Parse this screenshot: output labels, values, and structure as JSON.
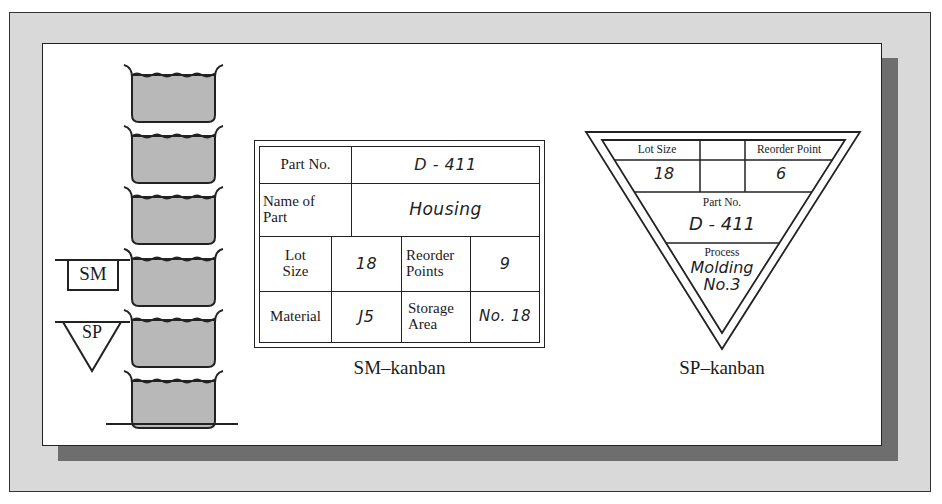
{
  "figure": {
    "left_stack": {
      "container_count": 6,
      "markers": [
        {
          "type": "SM",
          "shape": "rectangle",
          "label": "SM",
          "at_container": 4
        },
        {
          "type": "SP",
          "shape": "inverted-triangle",
          "label": "SP",
          "at_container": 5
        }
      ]
    },
    "sm_kanban": {
      "caption": "SM–kanban",
      "part_no_label": "Part No.",
      "part_no_value": "D - 411",
      "name_label_1": "Name of",
      "name_label_2": "Part",
      "name_value": "Housing",
      "lot_label_1": "Lot",
      "lot_label_2": "Size",
      "lot_value": "18",
      "reorder_label_1": "Reorder",
      "reorder_label_2": "Points",
      "reorder_value": "9",
      "material_label": "Material",
      "material_value": "J5",
      "storage_label_1": "Storage",
      "storage_label_2": "Area",
      "storage_value": "No. 18"
    },
    "sp_kanban": {
      "caption": "SP–kanban",
      "lot_label": "Lot Size",
      "lot_value": "18",
      "reorder_label": "Reorder Point",
      "reorder_value": "6",
      "part_no_label": "Part No.",
      "part_no_value": "D - 411",
      "process_label": "Process",
      "process_value_1": "Molding",
      "process_value_2": "No.3"
    },
    "colors": {
      "frame_bg": "#d9d9d9",
      "shadow": "#6e6e6e",
      "panel_bg": "#ffffff",
      "container_fill": "#b8b8b8",
      "line": "#222222"
    }
  }
}
